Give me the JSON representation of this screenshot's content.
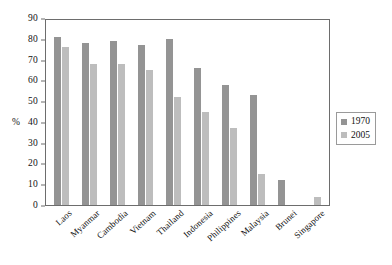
{
  "chart_data": {
    "type": "bar",
    "title": "",
    "subtitle": "",
    "xlabel": "",
    "ylabel": "%",
    "ylim": [
      0,
      90
    ],
    "yticks": [
      0,
      10,
      20,
      30,
      40,
      50,
      60,
      70,
      80,
      90
    ],
    "grid": false,
    "legend_position": "right",
    "categories": [
      "Laos",
      "Myanmar",
      "Cambodia",
      "Vietnam",
      "Thailand",
      "Indonesia",
      "Philippines",
      "Malaysia",
      "Brunei",
      "Singapore"
    ],
    "series": [
      {
        "name": "1970",
        "color": "#949494",
        "values": [
          81,
          78,
          79,
          77,
          80,
          66,
          58,
          53,
          12,
          0
        ]
      },
      {
        "name": "2005",
        "color": "#bdbdbd",
        "values": [
          76,
          68,
          68,
          65,
          52,
          45,
          37,
          15,
          0,
          4
        ]
      }
    ]
  },
  "axis": {
    "y_title": "%",
    "y_tick_labels": [
      "90",
      "80",
      "70",
      "60",
      "50",
      "40",
      "30",
      "20",
      "10",
      "0"
    ]
  },
  "legend": {
    "items": [
      {
        "label": "1970",
        "swatch": "series-1970-swatch"
      },
      {
        "label": "2005",
        "swatch": "series-2005-swatch"
      }
    ]
  },
  "x_axis_labels": [
    "Laos",
    "Myanmar",
    "Cambodia",
    "Vietnam",
    "Thailand",
    "Indonesia",
    "Philippines",
    "Malaysia",
    "Brunei",
    "Singapore"
  ],
  "colors": {
    "series_1970": "#949494",
    "series_2005": "#bdbdbd",
    "axis": "#6d6d6d",
    "background": "#ffffff",
    "text": "#111111"
  }
}
